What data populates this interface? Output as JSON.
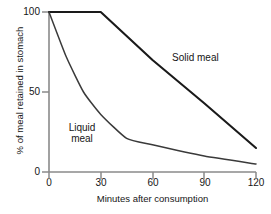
{
  "chart_data": {
    "type": "line",
    "title": "",
    "xlabel": "Minutes after consumption",
    "ylabel": "% of meal retained in stomach",
    "xlim": [
      0,
      120
    ],
    "ylim": [
      0,
      100
    ],
    "xticks": [
      "0",
      "30",
      "60",
      "90",
      "120"
    ],
    "xtick_values": [
      0,
      30,
      60,
      90,
      120
    ],
    "yticks": [
      "0",
      "50",
      "100"
    ],
    "ytick_values": [
      0,
      50,
      100
    ],
    "grid": false,
    "legend_position": "inline-annotation",
    "series": [
      {
        "name": "Solid meal",
        "color": "#1a1a1a",
        "x": [
          0,
          30,
          60,
          90,
          120
        ],
        "values": [
          100,
          100,
          70,
          43,
          15
        ]
      },
      {
        "name": "Liquid meal",
        "color": "#3a3a3a",
        "x": [
          0,
          10,
          20,
          30,
          45,
          60,
          90,
          120
        ],
        "values": [
          100,
          72,
          50,
          36,
          21,
          17,
          10,
          5
        ]
      }
    ],
    "annotations": [
      {
        "text": "Solid meal",
        "x": 92,
        "y": 75
      },
      {
        "text": "Liquid",
        "x": 18,
        "y": 31
      },
      {
        "text": "meal",
        "x": 18,
        "y": 24
      }
    ]
  },
  "axes": {
    "ylabel": "% of meal retained in stomach",
    "xlabel": "Minutes after consumption",
    "yticks": [
      {
        "label": "100"
      },
      {
        "label": "50"
      },
      {
        "label": "0"
      }
    ],
    "xticks": [
      {
        "label": "0"
      },
      {
        "label": "30"
      },
      {
        "label": "60"
      },
      {
        "label": "90"
      },
      {
        "label": "120"
      }
    ]
  },
  "annotations": {
    "solid_meal": "Solid meal",
    "liquid_meal_line1": "Liquid",
    "liquid_meal_line2": "meal"
  },
  "colors": {
    "axis": "#8a8a8a",
    "solid_series": "#1a1a1a",
    "liquid_series": "#3a3a3a",
    "background": "#ffffff",
    "text": "#151515"
  }
}
